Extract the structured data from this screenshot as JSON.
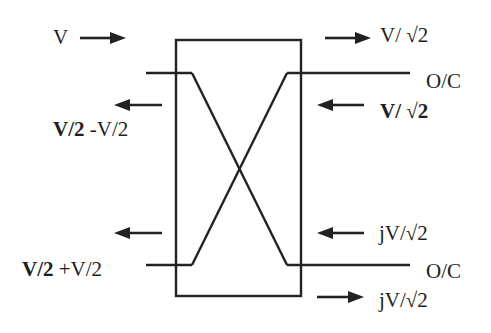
{
  "diagram": {
    "type": "directional-coupler",
    "labels": {
      "input_left_top": "V",
      "output_right_top": "V/ √2",
      "port_right_top": "O/C",
      "reflected_right_top": "V/ √2",
      "left_top_return_bold": "V/2",
      "left_top_return_rest": " -V/2",
      "reflected_right_bottom": "jV/√2",
      "port_right_bottom": "O/C",
      "output_right_bottom": "jV/√2",
      "left_bottom_return_bold": "V/2",
      "left_bottom_return_rest": " +V/2"
    },
    "colors": {
      "stroke": "#222222",
      "text": "#1e1e1e",
      "background": "#ffffff"
    }
  }
}
